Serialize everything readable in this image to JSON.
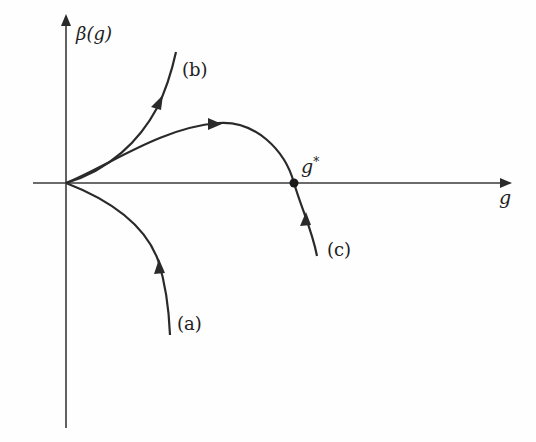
{
  "diagram": {
    "type": "renormalization-group-flow",
    "y_axis_label": "β(g)",
    "x_axis_label": "g",
    "fixed_point_label": "g",
    "fixed_point_superscript": "*",
    "curves": [
      {
        "id": "a",
        "label": "(a)",
        "description": "beta negative, flows toward origin (asymptotically free)"
      },
      {
        "id": "b",
        "label": "(b)",
        "description": "beta positive, grows monotonically"
      },
      {
        "id": "c",
        "label": "(c)",
        "description": "beta crosses zero at nontrivial fixed point g*"
      }
    ],
    "colors": {
      "stroke": "#2a2a2a",
      "background": "#fefefe"
    }
  }
}
